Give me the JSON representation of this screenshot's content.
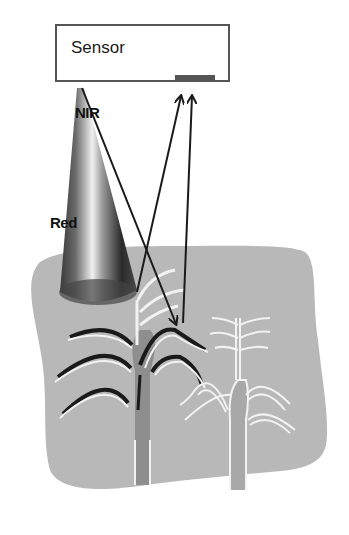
{
  "diagram": {
    "sensor": {
      "label": "Sensor"
    },
    "bands": [
      {
        "name": "nir",
        "label": "NIR"
      },
      {
        "name": "red",
        "label": "Red"
      }
    ],
    "colors": {
      "field": "#b8b8b8",
      "sensor_border": "#555555",
      "arrow": "#1a1a1a",
      "plant_outline_healthy": "#1a1a1a",
      "plant_outline_light": "#f2f2f2",
      "stem": "#8e8e8e"
    }
  }
}
